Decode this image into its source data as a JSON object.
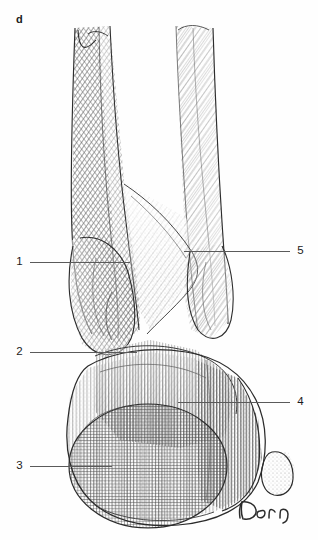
{
  "figure": {
    "panel_label": "d",
    "medium": "pen-and-ink cross-hatch anatomical illustration",
    "background_color": "#ffffff",
    "ink_color": "#3a3a3a",
    "leader_line_color": "#5a5a5a",
    "label_color": "#1b1b1b"
  },
  "callouts": [
    {
      "id": "1",
      "number": "1",
      "side": "left",
      "label_x": 15,
      "line_y": 262,
      "line_end_x": 130
    },
    {
      "id": "2",
      "number": "2",
      "side": "left",
      "label_x": 15,
      "line_y": 352,
      "line_end_x": 137
    },
    {
      "id": "3",
      "number": "3",
      "side": "left",
      "label_x": 15,
      "line_y": 466,
      "line_end_x": 112
    },
    {
      "id": "4",
      "number": "4",
      "side": "right",
      "label_x": 296,
      "line_y": 402,
      "line_end_x": 178
    },
    {
      "id": "5",
      "number": "5",
      "side": "right",
      "label_x": 296,
      "line_y": 251,
      "line_end_x": 184
    }
  ],
  "signature": {
    "text": "Dorn"
  }
}
